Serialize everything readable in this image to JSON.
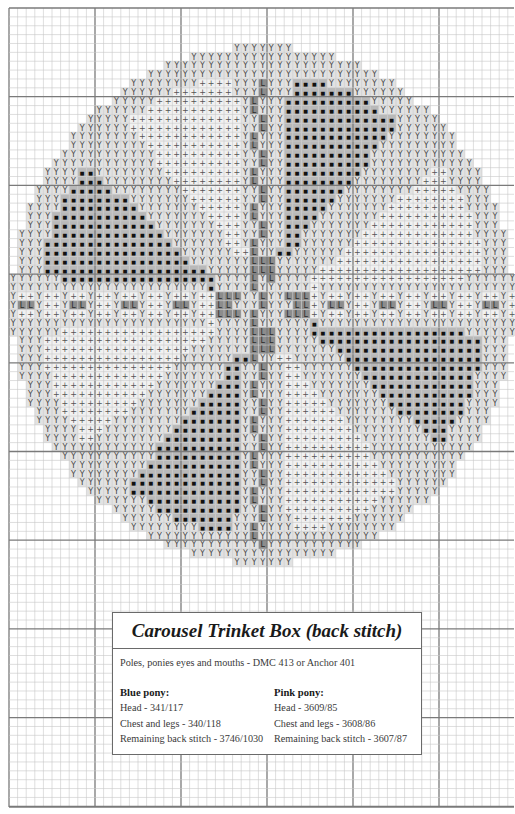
{
  "chart": {
    "grid": {
      "origin_x": 9,
      "origin_y": 8,
      "cell_w": 8.6,
      "cell_h": 8.87,
      "cols": 59,
      "rows": 90,
      "major_every": 10,
      "right_edge": 514,
      "bottom_edge": 807,
      "minor_line_color": "#c8c8c8",
      "major_line_color": "#7a7a7a"
    },
    "circle": {
      "center_col": 29.5,
      "center_row": 33.5,
      "radius_cells": 29.2,
      "outer_ring_width": 3.2
    },
    "pole": {
      "col": 29,
      "alt_col": 28,
      "row_from": 8,
      "row_to": 60
    },
    "symbols": {
      "Y": {
        "glyph": "Y",
        "bg": "#e2e2e2",
        "fg": "#444444",
        "meaning": "outline / border band"
      },
      "+": {
        "glyph": "+",
        "bg": "#f1f1f1",
        "fg": "#555555",
        "meaning": "light sector fill"
      },
      "dot": {
        "glyph": "■",
        "bg": "#b9b9b9",
        "fg": "#111111",
        "meaning": "dark sector fill"
      },
      "L": {
        "glyph": "L",
        "bg": "#8c8c8c",
        "fg": "#2a2a2a",
        "meaning": "pole / back stitch line"
      }
    },
    "sectors": {
      "dark_ranges_deg": [
        [
          45,
          90
        ],
        [
          135,
          180
        ],
        [
          225,
          270
        ],
        [
          315,
          360
        ]
      ],
      "light_ranges_deg": [
        [
          0,
          45
        ],
        [
          90,
          135
        ],
        [
          180,
          225
        ],
        [
          270,
          315
        ]
      ]
    }
  },
  "legend": {
    "title": "Carousel Trinket Box (back stitch)",
    "note": "Poles, ponies eyes and mouths - DMC 413 or Anchor 401",
    "blue": {
      "heading": "Blue pony:",
      "lines": [
        "Head - 341/117",
        "Chest and legs - 340/118",
        "Remaining back stitch - 3746/1030"
      ]
    },
    "pink": {
      "heading": "Pink pony:",
      "lines": [
        "Head - 3609/85",
        "Chest and legs - 3608/86",
        "Remaining back stitch - 3607/87"
      ]
    }
  }
}
